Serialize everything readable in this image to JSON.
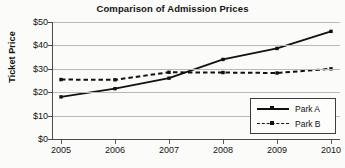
{
  "chart_data": {
    "type": "line",
    "title": "Comparison of Admission Prices",
    "xlabel": "",
    "ylabel": "Ticket Price",
    "categories": [
      "2005",
      "2006",
      "2007",
      "2008",
      "2009",
      "2010"
    ],
    "x": [
      2005,
      2006,
      2007,
      2008,
      2009,
      2010
    ],
    "series": [
      {
        "name": "Park A",
        "values": [
          18,
          21.5,
          26,
          34,
          38.7,
          46
        ],
        "linestyle": "solid",
        "marker": "square",
        "color": "#111111"
      },
      {
        "name": "Park B",
        "values": [
          25.4,
          25.3,
          28.5,
          28.4,
          28.2,
          30
        ],
        "linestyle": "dashed",
        "marker": "square",
        "color": "#111111"
      }
    ],
    "ylim": [
      0,
      50
    ],
    "ytick_labels": [
      "$0",
      "$10",
      "$20",
      "$30",
      "$40",
      "$50"
    ],
    "ytick_values": [
      0,
      10,
      20,
      30,
      40,
      50
    ],
    "grid": true,
    "grid_axis": "y",
    "legend_position": "lower-right",
    "legend_entries": [
      "Park A",
      "Park B"
    ]
  },
  "figure": {
    "background_color": "#fbfbfa",
    "axis_color": "#4a4a4a",
    "grid_color": "#b9b9b9"
  },
  "cropped_text_above": "  "
}
